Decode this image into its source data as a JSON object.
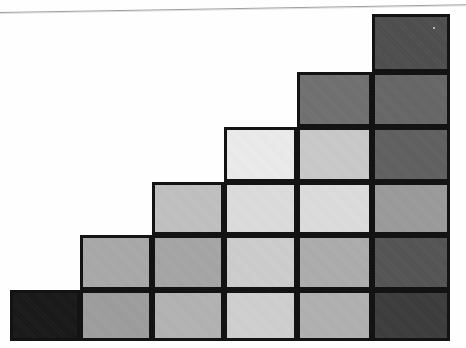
{
  "figure": {
    "title": "",
    "background_color": "#fefefe",
    "border_color": "#131313",
    "scan_line_color": "#8e8e8e",
    "width": 465,
    "height": 348
  },
  "chart_data": {
    "type": "heatmap",
    "title": "",
    "subtitle": "",
    "xlabel": "",
    "ylabel": "",
    "grid": true,
    "legend_position": "none",
    "columns": [
      "1",
      "2",
      "3",
      "4",
      "5",
      "6"
    ],
    "rows": [
      "1",
      "2",
      "3",
      "4",
      "5",
      "6"
    ],
    "column_heights": [
      1,
      2,
      3,
      4,
      5,
      6
    ],
    "column_bounds_px": [
      {
        "x": 10,
        "width": 70
      },
      {
        "x": 80,
        "width": 72
      },
      {
        "x": 152,
        "width": 72
      },
      {
        "x": 224,
        "width": 73
      },
      {
        "x": 297,
        "width": 75
      },
      {
        "x": 372,
        "width": 78
      }
    ],
    "row_bounds_px": [
      {
        "y": 14,
        "height": 58
      },
      {
        "y": 72,
        "height": 55
      },
      {
        "y": 127,
        "height": 55
      },
      {
        "y": 182,
        "height": 53
      },
      {
        "y": 235,
        "height": 55
      },
      {
        "y": 290,
        "height": 51
      }
    ],
    "cells": [
      {
        "row": 0,
        "col": 5,
        "color": "#4d4d4d",
        "value": 0.3
      },
      {
        "row": 1,
        "col": 4,
        "color": "#6f6f6f",
        "value": 0.44
      },
      {
        "row": 1,
        "col": 5,
        "color": "#666666",
        "value": 0.4
      },
      {
        "row": 2,
        "col": 3,
        "color": "#ebebeb",
        "value": 0.92
      },
      {
        "row": 2,
        "col": 4,
        "color": "#c9c9c9",
        "value": 0.79
      },
      {
        "row": 2,
        "col": 5,
        "color": "#5f5f5f",
        "value": 0.37
      },
      {
        "row": 3,
        "col": 2,
        "color": "#c0c0c0",
        "value": 0.75
      },
      {
        "row": 3,
        "col": 3,
        "color": "#dcdcdc",
        "value": 0.86
      },
      {
        "row": 3,
        "col": 4,
        "color": "#dcdcdc",
        "value": 0.86
      },
      {
        "row": 3,
        "col": 5,
        "color": "#9a9a9a",
        "value": 0.6
      },
      {
        "row": 4,
        "col": 1,
        "color": "#a8a8a8",
        "value": 0.66
      },
      {
        "row": 4,
        "col": 2,
        "color": "#a5a5a5",
        "value": 0.65
      },
      {
        "row": 4,
        "col": 3,
        "color": "#cdcdcd",
        "value": 0.8
      },
      {
        "row": 4,
        "col": 4,
        "color": "#acacac",
        "value": 0.67
      },
      {
        "row": 4,
        "col": 5,
        "color": "#535353",
        "value": 0.33
      },
      {
        "row": 5,
        "col": 0,
        "color": "#171717",
        "value": 0.09
      },
      {
        "row": 5,
        "col": 1,
        "color": "#9d9d9d",
        "value": 0.62
      },
      {
        "row": 5,
        "col": 2,
        "color": "#b2b2b2",
        "value": 0.7
      },
      {
        "row": 5,
        "col": 3,
        "color": "#cfcfcf",
        "value": 0.81
      },
      {
        "row": 5,
        "col": 4,
        "color": "#b0b0b0",
        "value": 0.69
      },
      {
        "row": 5,
        "col": 5,
        "color": "#3b3b3b",
        "value": 0.23
      }
    ]
  }
}
